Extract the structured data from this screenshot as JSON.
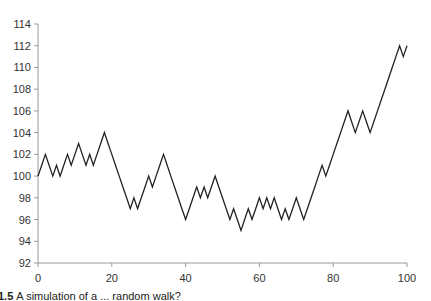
{
  "chart_data": {
    "type": "line",
    "title": "",
    "xlabel": "",
    "ylabel": "",
    "xlim": [
      0,
      100
    ],
    "ylim": [
      92,
      114
    ],
    "grid": false,
    "legend": null,
    "x_ticks": [
      0,
      20,
      40,
      60,
      80,
      100
    ],
    "y_ticks": [
      92,
      94,
      96,
      98,
      100,
      102,
      104,
      106,
      108,
      110,
      112,
      114
    ],
    "series": [
      {
        "name": "random walk",
        "color": "#222222",
        "x": [
          0,
          1,
          2,
          3,
          4,
          5,
          6,
          7,
          8,
          9,
          10,
          11,
          12,
          13,
          14,
          15,
          16,
          17,
          18,
          19,
          20,
          21,
          22,
          23,
          24,
          25,
          26,
          27,
          28,
          29,
          30,
          31,
          32,
          33,
          34,
          35,
          36,
          37,
          38,
          39,
          40,
          41,
          42,
          43,
          44,
          45,
          46,
          47,
          48,
          49,
          50,
          51,
          52,
          53,
          54,
          55,
          56,
          57,
          58,
          59,
          60,
          61,
          62,
          63,
          64,
          65,
          66,
          67,
          68,
          69,
          70,
          71,
          72,
          73,
          74,
          75,
          76,
          77,
          78,
          79,
          80,
          81,
          82,
          83,
          84,
          85,
          86,
          87,
          88,
          89,
          90,
          91,
          92,
          93,
          94,
          95,
          96,
          97,
          98,
          99,
          100
        ],
        "values": [
          100,
          101,
          102,
          101,
          100,
          101,
          100,
          101,
          102,
          101,
          102,
          103,
          102,
          101,
          102,
          101,
          102,
          103,
          104,
          103,
          102,
          101,
          100,
          99,
          98,
          97,
          98,
          97,
          98,
          99,
          100,
          99,
          100,
          101,
          102,
          101,
          100,
          99,
          98,
          97,
          96,
          97,
          98,
          99,
          98,
          99,
          98,
          99,
          100,
          99,
          98,
          97,
          96,
          97,
          96,
          95,
          96,
          97,
          96,
          97,
          98,
          97,
          98,
          97,
          98,
          97,
          96,
          97,
          96,
          97,
          98,
          97,
          96,
          97,
          98,
          99,
          100,
          101,
          100,
          101,
          102,
          103,
          104,
          105,
          106,
          105,
          104,
          105,
          106,
          105,
          104,
          105,
          106,
          107,
          108,
          109,
          110,
          111,
          112,
          111,
          112
        ]
      }
    ]
  },
  "caption": {
    "number": "1.5",
    "text": "A simulation of a ... random walk?"
  }
}
